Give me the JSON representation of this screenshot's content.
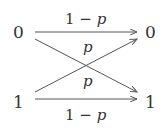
{
  "diagram": {
    "title": "",
    "type": "binary symmetric channel",
    "inputs": [
      {
        "label": "0"
      },
      {
        "label": "1"
      }
    ],
    "outputs": [
      {
        "label": "0"
      },
      {
        "label": "1"
      }
    ],
    "edges": [
      {
        "from": "0",
        "to": "0",
        "label_num": "1",
        "label_op": " − ",
        "label_var": "p"
      },
      {
        "from": "0",
        "to": "1",
        "label_var": "p"
      },
      {
        "from": "1",
        "to": "0",
        "label_var": "p"
      },
      {
        "from": "1",
        "to": "1",
        "label_num": "1",
        "label_op": " − ",
        "label_var": "p"
      }
    ],
    "colors": {
      "text": "#333333",
      "line": "#555555",
      "background": "#ffffff"
    }
  }
}
